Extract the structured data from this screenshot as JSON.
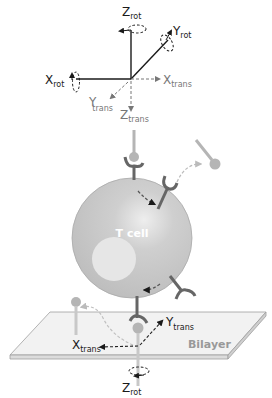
{
  "diagram": {
    "top_axes": {
      "z_rot": {
        "main": "Z",
        "sub": "rot"
      },
      "y_rot": {
        "main": "Y",
        "sub": "rot"
      },
      "x_rot": {
        "main": "X",
        "sub": "rot"
      },
      "x_trans": {
        "main": "X",
        "sub": "trans"
      },
      "y_trans": {
        "main": "Y",
        "sub": "trans"
      },
      "z_trans": {
        "main": "Z",
        "sub": "trans"
      }
    },
    "cell_label": "T cell",
    "bilayer_label": "Bilayer",
    "bottom_axes": {
      "y_trans": {
        "main": "Y",
        "sub": "trans"
      },
      "x_trans": {
        "main": "X",
        "sub": "trans"
      },
      "z_rot": {
        "main": "Z",
        "sub": "rot"
      }
    },
    "colors": {
      "cell_fill": "#c4c4c4",
      "nucleus_fill": "#e6e6e6",
      "receptor": "#666666",
      "ligand": "#b5b5b5",
      "bilayer_fill": "#f0f0f0",
      "bilayer_edge": "#a0a0a0",
      "axis_solid": "#1a1a1a",
      "axis_dashed": "#777777"
    }
  }
}
